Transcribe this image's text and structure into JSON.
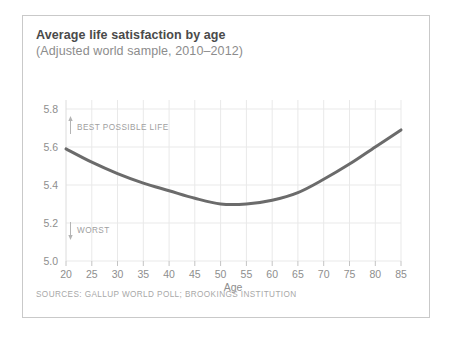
{
  "card": {
    "title": "Average life satisfaction by age",
    "subtitle": "(Adjusted world sample, 2010–2012)",
    "source": "SOURCES: GALLUP WORLD POLL; BROOKINGS INSTITUTION"
  },
  "annotations": {
    "top": "BEST POSSIBLE LIFE",
    "top_arrow": "↑",
    "bottom": "WORST",
    "bottom_arrow": "↓"
  },
  "colors": {
    "line": "#6b6b6b",
    "grid": "#e9e9e9",
    "axis": "#bdbdbd",
    "tick_text": "#8e8e8e",
    "title": "#4a4a4a",
    "subtitle": "#8c8c8c",
    "source": "#a8a8a8",
    "card_border": "#c9c9c9",
    "background": "#ffffff"
  },
  "chart_data": {
    "type": "line",
    "title": "Average life satisfaction by age",
    "subtitle": "(Adjusted world sample, 2010–2012)",
    "xlabel": "Age",
    "ylabel": "",
    "xlim": [
      20,
      85
    ],
    "ylim": [
      5.0,
      5.8
    ],
    "xticks": [
      20,
      25,
      30,
      35,
      40,
      45,
      50,
      55,
      60,
      65,
      70,
      75,
      80,
      85
    ],
    "yticks": [
      5.0,
      5.2,
      5.4,
      5.6,
      5.8
    ],
    "xtick_labels": [
      "20",
      "25",
      "30",
      "35",
      "40",
      "45",
      "50",
      "55",
      "60",
      "65",
      "70",
      "75",
      "80",
      "85"
    ],
    "ytick_labels": [
      "5.0",
      "5.2",
      "5.4",
      "5.6",
      "5.8"
    ],
    "grid": true,
    "legend": false,
    "x": [
      20,
      25,
      30,
      35,
      40,
      45,
      50,
      55,
      60,
      65,
      70,
      75,
      80,
      85
    ],
    "values": [
      5.59,
      5.52,
      5.46,
      5.41,
      5.37,
      5.33,
      5.3,
      5.3,
      5.32,
      5.36,
      5.43,
      5.51,
      5.6,
      5.69
    ],
    "series": [
      {
        "name": "Average life satisfaction",
        "values": [
          5.59,
          5.52,
          5.46,
          5.41,
          5.37,
          5.33,
          5.3,
          5.3,
          5.32,
          5.36,
          5.43,
          5.51,
          5.6,
          5.69
        ]
      }
    ],
    "minimum": {
      "age": 52,
      "value": 5.29
    },
    "annotations": [
      {
        "text": "BEST POSSIBLE LIFE",
        "position": "upper-left",
        "arrow": "up"
      },
      {
        "text": "WORST",
        "position": "lower-left",
        "arrow": "down"
      }
    ]
  }
}
